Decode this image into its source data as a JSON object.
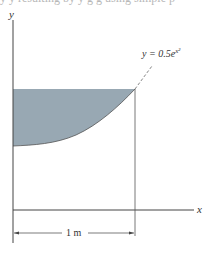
{
  "top_clipped_text": "y y resulting by y g g using simple p",
  "figure": {
    "axis_x_label": "x",
    "axis_y_label": "y",
    "curve_label_prefix": "y = 0.5e",
    "curve_label_exp": "x²",
    "dimension_label": "1 m",
    "colors": {
      "shaded_region": "#98a8b3",
      "lines": "#444444",
      "dashed": "#666666"
    }
  }
}
